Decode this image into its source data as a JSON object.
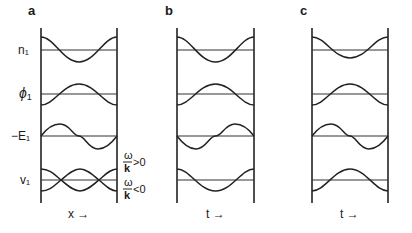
{
  "figure": {
    "panels": [
      {
        "id": "a",
        "letter": "a",
        "axis_label": "x →",
        "x_left": 41,
        "x_right": 117
      },
      {
        "id": "b",
        "letter": "b",
        "axis_label": "t →",
        "x_left": 177,
        "x_right": 254
      },
      {
        "id": "c",
        "letter": "c",
        "axis_label": "t →",
        "x_left": 312,
        "x_right": 388
      }
    ],
    "rows": [
      {
        "id": "n1",
        "label": "n₁",
        "baseline_y": 50
      },
      {
        "id": "phi1",
        "label": "ϕ1",
        "baseline_y": 94
      },
      {
        "id": "negE1",
        "label": "−E₁",
        "baseline_y": 136
      },
      {
        "id": "v1",
        "label": "v₁",
        "baseline_y": 180
      }
    ],
    "annotations": {
      "omega_k_pos": {
        "num": "ω",
        "den": "k",
        "rel": ">0"
      },
      "omega_k_neg": {
        "num": "ω",
        "den": "k",
        "rel": "<0"
      }
    },
    "colors": {
      "ink": "#222222",
      "background": "#ffffff"
    }
  },
  "labels": {
    "a": "a",
    "b": "b",
    "c": "c",
    "n1": "n₁",
    "phi": "ϕ",
    "phi_sub": "1",
    "negE1": "−E₁",
    "v1": "v₁",
    "x_axis": "x →",
    "t_axis": "t →",
    "omega": "ω",
    "k": "k",
    "gt0": ">0",
    "lt0": "<0"
  }
}
